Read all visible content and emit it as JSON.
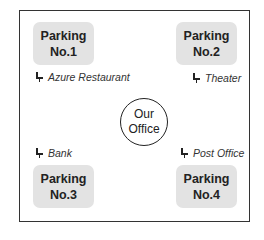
{
  "diagram": {
    "center": {
      "line1": "Our",
      "line2": "Office"
    },
    "parkings": [
      {
        "line1": "Parking",
        "line2": "No.1"
      },
      {
        "line1": "Parking",
        "line2": "No.2"
      },
      {
        "line1": "Parking",
        "line2": "No.3"
      },
      {
        "line1": "Parking",
        "line2": "No.4"
      }
    ],
    "landmarks": [
      {
        "icon": "pin-icon",
        "label": "Azure Restaurant"
      },
      {
        "icon": "pin-icon",
        "label": "Theater"
      },
      {
        "icon": "pin-icon",
        "label": "Bank"
      },
      {
        "icon": "pin-icon",
        "label": "Post Office"
      }
    ],
    "colors": {
      "parking_fill": "#e3e3e3",
      "border": "#333333",
      "text": "#222222"
    }
  }
}
